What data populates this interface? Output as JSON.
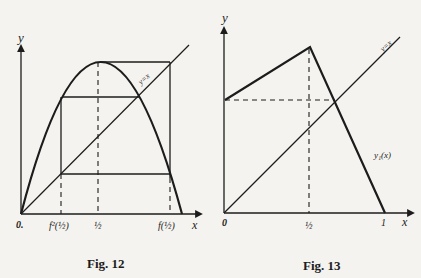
{
  "figures": [
    {
      "id": "fig12",
      "caption": "Fig. 12",
      "axis_x_label": "x",
      "axis_y_label": "y",
      "diagonal_label": "y=x",
      "tick_labels": [
        "0.",
        "f²(½)",
        "½",
        "f(½)"
      ],
      "origin_label": "0.",
      "tick_f2": "f²(½)",
      "tick_half": "½",
      "tick_f1": "f(½)"
    },
    {
      "id": "fig13",
      "caption": "Fig. 13",
      "axis_x_label": "x",
      "axis_y_label": "y",
      "diagonal_label": "y=x",
      "curve_label": "y₁(x)",
      "origin_label": "0",
      "tick_half": "½",
      "tick_one": "1"
    }
  ],
  "colors": {
    "ink": "#1c1c1c",
    "paper": "#f4f3ef"
  }
}
